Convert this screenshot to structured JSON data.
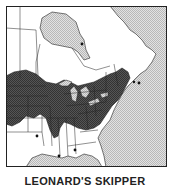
{
  "figure": {
    "caption": "LEONARD'S SKIPPER",
    "type": "range map"
  },
  "map": {
    "region": "Eastern North America",
    "legend_implied": {
      "range": "dark crosshatch",
      "water": "light stipple",
      "isolated_record": "dot"
    },
    "colors": {
      "range": "#4a4a4a",
      "water": "#cfcfcf",
      "land": "#ffffff",
      "border": "#222222"
    },
    "isolated_records": [
      {
        "x": 31,
        "y": 130
      },
      {
        "x": 53,
        "y": 150
      },
      {
        "x": 69,
        "y": 144
      },
      {
        "x": 76,
        "y": 38
      },
      {
        "x": 133,
        "y": 77
      },
      {
        "x": 128,
        "y": 76
      }
    ]
  }
}
